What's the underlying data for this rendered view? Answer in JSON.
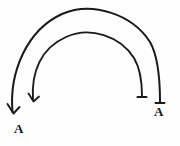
{
  "figure": {
    "background_color": "#fffefe",
    "stroke_color": "#1a1a1a",
    "title": "",
    "width": 180,
    "height": 146
  },
  "arcs": [
    {
      "id": "outer-arc",
      "name": "outer-semicircular-arrow",
      "stroke_width": 2.0,
      "path": "M 12.5 112 C 9 72, 27 30, 62 14 C 92 1, 132 14, 150 42 C 158 56, 160 82, 160 102",
      "start_point": [
        12.5,
        112
      ],
      "peak_point": [
        92,
        9
      ],
      "end_point": [
        160,
        102
      ]
    },
    {
      "id": "inner-arc",
      "name": "inner-semicircular-arrow",
      "stroke_width": 1.9,
      "path": "M 33 100 C 31 72, 41 48, 66 37 C 90 26, 120 36, 134 58 C 140 68, 142 84, 142 96",
      "start_point": [
        33,
        100
      ],
      "peak_point": [
        92,
        31
      ],
      "end_point": [
        142,
        96
      ]
    }
  ],
  "arrowheads": [
    {
      "id": "outer-left-head",
      "name": "arrowhead-outer-left",
      "style": "open-v-down",
      "at": [
        12.5,
        112
      ],
      "path": "M 7.5 104 L 13.5 113.5 L 19.5 107"
    },
    {
      "id": "inner-left-head",
      "name": "arrowhead-inner-left",
      "style": "open-v-down",
      "at": [
        33,
        100
      ],
      "path": "M 28.5 93.5 L 33.5 101.5 L 39 96.5"
    },
    {
      "id": "inner-right-head",
      "name": "arrowhead-inner-right",
      "style": "flat-barb",
      "at": [
        142,
        96
      ],
      "path": "M 137.5 97 L 146.5 97"
    },
    {
      "id": "outer-right-head",
      "name": "arrowhead-outer-right",
      "style": "flat-barb",
      "at": [
        160,
        102
      ],
      "path": "M 155.5 103 L 164.5 103"
    }
  ],
  "labels": {
    "left": "A",
    "right": "A"
  }
}
